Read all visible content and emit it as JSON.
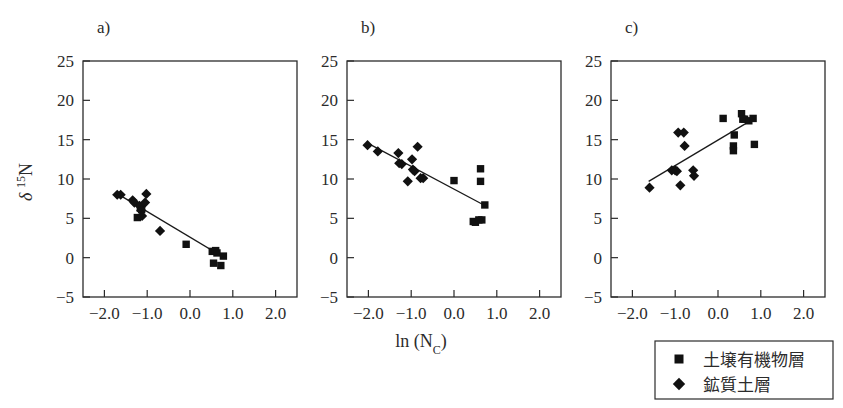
{
  "figure": {
    "axis_x_title": "ln (N",
    "axis_x_title_sub": "C",
    "axis_x_title_close": ")",
    "axis_y_title_delta": "δ",
    "axis_y_title_sup": "15",
    "axis_y_title_n": "N"
  },
  "legend": {
    "items": [
      {
        "marker": "square",
        "label": "土壌有機物層"
      },
      {
        "marker": "diamond",
        "label": "鉱質土層"
      }
    ]
  },
  "axes": {
    "x_ticks": [
      "-2.0",
      "-1.0",
      "0.0",
      "1.0",
      "2.0"
    ],
    "x_tick_values": [
      -2.0,
      -1.0,
      0.0,
      1.0,
      2.0
    ],
    "y_ticks": [
      "-5",
      "0",
      "5",
      "10",
      "15",
      "20",
      "25"
    ],
    "y_tick_values": [
      -5,
      0,
      5,
      10,
      15,
      20,
      25
    ],
    "xlim": [
      -2.5,
      2.5
    ],
    "ylim": [
      -5,
      25
    ]
  },
  "chart_data": [
    {
      "type": "scatter",
      "title": "a)",
      "xlabel": "ln (NC)",
      "ylabel": "d 15N",
      "xlim": [
        -2.5,
        2.5
      ],
      "ylim": [
        -5,
        25
      ],
      "grid": false,
      "series": [
        {
          "name": "土壌有機物層",
          "marker": "square",
          "points": [
            [
              -1.23,
              5.1
            ],
            [
              -1.16,
              6.3
            ],
            [
              -1.13,
              6.1
            ],
            [
              -0.09,
              1.7
            ],
            [
              0.52,
              0.8
            ],
            [
              0.6,
              0.9
            ],
            [
              0.63,
              0.6
            ],
            [
              0.55,
              -0.7
            ],
            [
              0.72,
              -1.0
            ],
            [
              0.78,
              0.2
            ]
          ]
        },
        {
          "name": "鉱質土層",
          "marker": "diamond",
          "points": [
            [
              -1.7,
              8.0
            ],
            [
              -1.62,
              8.0
            ],
            [
              -1.34,
              7.3
            ],
            [
              -1.3,
              7.0
            ],
            [
              -1.18,
              6.6
            ],
            [
              -1.14,
              6.0
            ],
            [
              -1.12,
              5.3
            ],
            [
              -1.05,
              7.0
            ],
            [
              -1.02,
              8.1
            ],
            [
              -0.7,
              3.4
            ]
          ]
        }
      ],
      "fit_line": {
        "x1": -1.72,
        "y1": 8.2,
        "x2": 0.8,
        "y2": 0.0
      }
    },
    {
      "type": "scatter",
      "title": "b)",
      "xlabel": "ln (NC)",
      "ylabel": "d 15N",
      "xlim": [
        -2.5,
        2.5
      ],
      "ylim": [
        -5,
        25
      ],
      "grid": false,
      "series": [
        {
          "name": "土壌有機物層",
          "marker": "square",
          "points": [
            [
              0.0,
              9.8
            ],
            [
              0.62,
              11.3
            ],
            [
              0.62,
              9.7
            ],
            [
              0.72,
              6.7
            ],
            [
              0.45,
              4.6
            ],
            [
              0.5,
              4.5
            ],
            [
              0.58,
              4.8
            ],
            [
              0.65,
              4.8
            ]
          ]
        },
        {
          "name": "鉱質土層",
          "marker": "diamond",
          "points": [
            [
              -2.02,
              14.3
            ],
            [
              -1.78,
              13.5
            ],
            [
              -1.3,
              13.3
            ],
            [
              -1.28,
              12.0
            ],
            [
              -1.22,
              11.9
            ],
            [
              -1.08,
              9.7
            ],
            [
              -0.98,
              12.5
            ],
            [
              -0.96,
              11.2
            ],
            [
              -0.92,
              11.0
            ],
            [
              -0.85,
              14.1
            ],
            [
              -0.78,
              10.1
            ],
            [
              -0.72,
              10.1
            ]
          ]
        }
      ],
      "fit_line": {
        "x1": -2.03,
        "y1": 14.6,
        "x2": 0.73,
        "y2": 6.6
      }
    },
    {
      "type": "scatter",
      "title": "c)",
      "xlabel": "ln (NC)",
      "ylabel": "d 15N",
      "xlim": [
        -2.5,
        2.5
      ],
      "ylim": [
        -5,
        25
      ],
      "grid": false,
      "series": [
        {
          "name": "土壌有機物層",
          "marker": "square",
          "points": [
            [
              0.12,
              17.7
            ],
            [
              0.38,
              15.6
            ],
            [
              0.36,
              14.2
            ],
            [
              0.36,
              13.6
            ],
            [
              0.55,
              18.3
            ],
            [
              0.58,
              17.6
            ],
            [
              0.62,
              17.6
            ],
            [
              0.72,
              17.4
            ],
            [
              0.82,
              17.7
            ],
            [
              0.85,
              14.4
            ]
          ]
        },
        {
          "name": "鉱質土層",
          "marker": "diamond",
          "points": [
            [
              -1.6,
              8.9
            ],
            [
              -1.08,
              11.1
            ],
            [
              -1.0,
              11.1
            ],
            [
              -0.96,
              11.0
            ],
            [
              -0.93,
              15.9
            ],
            [
              -0.88,
              9.2
            ],
            [
              -0.8,
              15.9
            ],
            [
              -0.78,
              14.2
            ],
            [
              -0.58,
              11.1
            ],
            [
              -0.56,
              10.4
            ]
          ]
        }
      ],
      "fit_line": {
        "x1": -1.62,
        "y1": 9.7,
        "x2": 0.88,
        "y2": 17.8
      }
    }
  ]
}
